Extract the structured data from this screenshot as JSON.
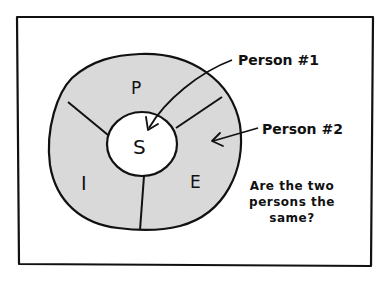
{
  "diagram": {
    "colors": {
      "ink": "#111111",
      "ring_fill": "#d9d9d9",
      "core_fill": "#ffffff",
      "background": "#ffffff"
    },
    "core": {
      "label": "S"
    },
    "segments": [
      {
        "label": "P"
      },
      {
        "label": "E"
      },
      {
        "label": "I"
      }
    ],
    "callouts": [
      {
        "label": "Person #1",
        "points_to": "S"
      },
      {
        "label": "Person #2",
        "points_to": "E"
      }
    ],
    "question": {
      "line1": "Are the two",
      "line2": "persons the",
      "line3": "same?"
    }
  }
}
